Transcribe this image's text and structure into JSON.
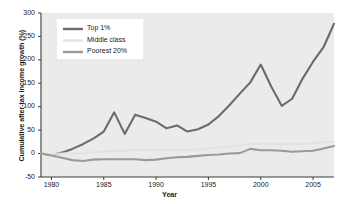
{
  "chart_data": {
    "type": "line",
    "title": "",
    "xlabel": "Year",
    "ylabel": "Cumulative after-tax income growth (%)",
    "xlim": [
      1979,
      2007
    ],
    "ylim": [
      -50,
      300
    ],
    "grid": false,
    "legend_position": "upper left",
    "xticks": [
      1980,
      1985,
      1990,
      1995,
      2000,
      2005
    ],
    "xtick_labels": [
      "1980",
      "1985",
      "1990",
      "1995",
      "2000",
      "2005"
    ],
    "yticks": [
      -50,
      0,
      50,
      100,
      150,
      200,
      250,
      300
    ],
    "ytick_labels": [
      "-50",
      "0",
      "50",
      "100",
      "150",
      "200",
      "250",
      "300"
    ],
    "x": [
      1979,
      1980,
      1981,
      1982,
      1983,
      1984,
      1985,
      1986,
      1987,
      1988,
      1989,
      1990,
      1991,
      1992,
      1993,
      1994,
      1995,
      1996,
      1997,
      1998,
      1999,
      2000,
      2001,
      2002,
      2003,
      2004,
      2005,
      2006,
      2007
    ],
    "series": [
      {
        "name": "Top 1%",
        "color": "#6b6b6b",
        "width": 2.1,
        "values": [
          0,
          -3,
          2,
          10,
          20,
          32,
          47,
          88,
          42,
          83,
          76,
          68,
          54,
          60,
          47,
          52,
          62,
          80,
          103,
          128,
          152,
          190,
          143,
          102,
          117,
          160,
          196,
          227,
          277
        ]
      },
      {
        "name": "Middle class",
        "color": "#e2e2e2",
        "width": 1.9,
        "values": [
          0,
          -1,
          0,
          0,
          1,
          3,
          4,
          6,
          6,
          8,
          9,
          8,
          7,
          8,
          8,
          9,
          11,
          13,
          15,
          18,
          20,
          21,
          20,
          20,
          20,
          21,
          22,
          24,
          25
        ]
      },
      {
        "name": "Poorest 20%",
        "color": "#9a9a9a",
        "width": 2.1,
        "values": [
          0,
          -4,
          -9,
          -14,
          -16,
          -13,
          -12,
          -12,
          -12,
          -12,
          -14,
          -13,
          -10,
          -8,
          -7,
          -5,
          -3,
          -2,
          0,
          1,
          10,
          7,
          7,
          6,
          4,
          5,
          6,
          11,
          16
        ]
      }
    ],
    "legend_entries": [
      {
        "label": "Top 1%",
        "color": "#6b6b6b"
      },
      {
        "label": "Middle class",
        "color": "#e2e2e2"
      },
      {
        "label": "Poorest 20%",
        "color": "#9a9a9a"
      }
    ],
    "style": {
      "page_background": "#ffffff",
      "plot_background": "#ebebeb",
      "axis_color": "#3b3b3b",
      "text_color": "#1a1a1a",
      "legend_background": "#ffffff"
    }
  }
}
